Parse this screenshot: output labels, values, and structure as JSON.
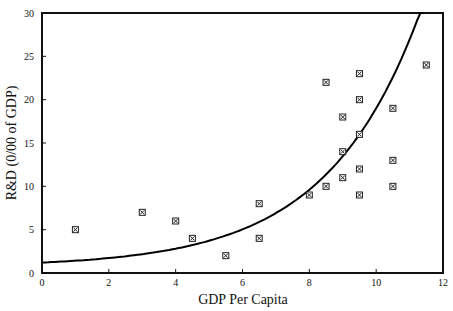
{
  "chart_data": {
    "type": "scatter",
    "title": "",
    "xlabel": "GDP Per Capita",
    "ylabel": "R&D (0/00 of GDP)",
    "xlim": [
      0,
      12
    ],
    "ylim": [
      0,
      30
    ],
    "x_ticks": [
      0,
      2,
      4,
      6,
      8,
      10,
      12
    ],
    "y_ticks": [
      0,
      5,
      10,
      15,
      20,
      25,
      30
    ],
    "grid": false,
    "legend": null,
    "series": [
      {
        "name": "Countries",
        "type": "scatter",
        "marker": "boxed-x",
        "points": [
          {
            "x": 1,
            "y": 5
          },
          {
            "x": 3,
            "y": 7
          },
          {
            "x": 4,
            "y": 6
          },
          {
            "x": 4.5,
            "y": 4
          },
          {
            "x": 5.5,
            "y": 2
          },
          {
            "x": 6.5,
            "y": 8
          },
          {
            "x": 6.5,
            "y": 4
          },
          {
            "x": 8,
            "y": 9
          },
          {
            "x": 8.5,
            "y": 22
          },
          {
            "x": 8.5,
            "y": 10
          },
          {
            "x": 9,
            "y": 18
          },
          {
            "x": 9,
            "y": 14
          },
          {
            "x": 9,
            "y": 11
          },
          {
            "x": 9.5,
            "y": 23
          },
          {
            "x": 9.5,
            "y": 20
          },
          {
            "x": 9.5,
            "y": 16
          },
          {
            "x": 9.5,
            "y": 12
          },
          {
            "x": 9.5,
            "y": 9
          },
          {
            "x": 10.5,
            "y": 19
          },
          {
            "x": 10.5,
            "y": 13
          },
          {
            "x": 10.5,
            "y": 10
          },
          {
            "x": 11.5,
            "y": 24
          }
        ]
      },
      {
        "name": "Exponential fit",
        "type": "line",
        "model": "y = 0.7 + 0.5*exp(0.36*x)",
        "params": {
          "c": 0.7,
          "a": 0.5,
          "b": 0.36
        },
        "x_range": [
          0,
          11.42
        ]
      }
    ]
  },
  "colors": {
    "axis": "#111111",
    "marker": "#222222",
    "curve": "#000000",
    "background": "#ffffff"
  }
}
